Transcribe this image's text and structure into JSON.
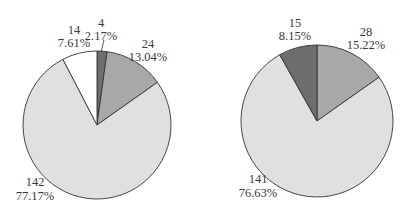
{
  "top_text_fragment": "(cut-off line of text above the charts)",
  "colors": {
    "dark": "#6e6e6e",
    "medium": "#a8a8a8",
    "light": "#e0e0e0",
    "white": "#ffffff",
    "stroke": "#333333"
  },
  "chart_data": [
    {
      "type": "pie",
      "title": "",
      "start_angle": "12 o'clock, clockwise",
      "slices": [
        {
          "value": 4,
          "percent": "2.17%",
          "shade": "dark"
        },
        {
          "value": 24,
          "percent": "13.04%",
          "shade": "medium"
        },
        {
          "value": 142,
          "percent": "77.17%",
          "shade": "light"
        },
        {
          "value": 14,
          "percent": "7.61%",
          "shade": "white"
        }
      ],
      "total": 184
    },
    {
      "type": "pie",
      "title": "",
      "start_angle": "12 o'clock, clockwise",
      "slices": [
        {
          "value": 28,
          "percent": "15.22%",
          "shade": "medium"
        },
        {
          "value": 141,
          "percent": "76.63%",
          "shade": "light"
        },
        {
          "value": 15,
          "percent": "8.15%",
          "shade": "dark"
        }
      ],
      "total": 184
    }
  ],
  "labels": {
    "left": [
      {
        "value": "4",
        "percent": "2.17%"
      },
      {
        "value": "24",
        "percent": "13.04%"
      },
      {
        "value": "142",
        "percent": "77.17%"
      },
      {
        "value": "14",
        "percent": "7.61%"
      }
    ],
    "right": [
      {
        "value": "28",
        "percent": "15.22%"
      },
      {
        "value": "141",
        "percent": "76.63%"
      },
      {
        "value": "15",
        "percent": "8.15%"
      }
    ]
  }
}
